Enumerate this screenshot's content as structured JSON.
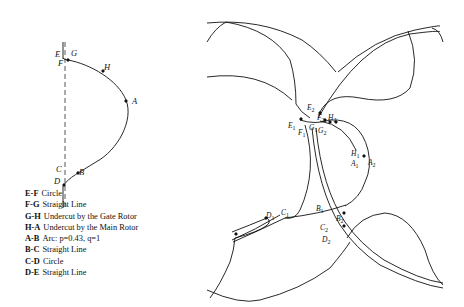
{
  "figure": {
    "left_panel": {
      "description": "Single rotor profile with labeled points",
      "point_labels": [
        "E",
        "G",
        "F",
        "H",
        "A",
        "C",
        "B",
        "D"
      ]
    },
    "legend": [
      {
        "key": "E-F",
        "desc": "Circle"
      },
      {
        "key": "F-G",
        "desc": "Straight Line"
      },
      {
        "key": "G-H",
        "desc": "Undercut by the Gate Rotor"
      },
      {
        "key": "H-A",
        "desc": "Undercut by the Main Rotor"
      },
      {
        "key": "A-B",
        "desc": "Arc: p=0.43, q=1"
      },
      {
        "key": "B-C",
        "desc": "Straight Line"
      },
      {
        "key": "C-D",
        "desc": "Circle"
      },
      {
        "key": "D-E",
        "desc": "Straight Line"
      }
    ],
    "right_panel": {
      "description": "Meshing main and gate rotor profiles",
      "point_labels": [
        {
          "base": "E",
          "sub": "2"
        },
        {
          "base": "F",
          "sub": "2"
        },
        {
          "base": "H",
          "sub": "2"
        },
        {
          "base": "E",
          "sub": "1"
        },
        {
          "base": "F",
          "sub": "1"
        },
        {
          "base": "G",
          "sub": "1"
        },
        {
          "base": "G",
          "sub": "2"
        },
        {
          "base": "H",
          "sub": "1"
        },
        {
          "base": "A",
          "sub": "1"
        },
        {
          "base": "A",
          "sub": "2"
        },
        {
          "base": "D",
          "sub": "1"
        },
        {
          "base": "C",
          "sub": "1"
        },
        {
          "base": "B",
          "sub": "1"
        },
        {
          "base": "B",
          "sub": "2"
        },
        {
          "base": "C",
          "sub": "2"
        },
        {
          "base": "D",
          "sub": "2"
        }
      ]
    },
    "colors": {
      "line": "#111111",
      "background": "#ffffff"
    }
  }
}
